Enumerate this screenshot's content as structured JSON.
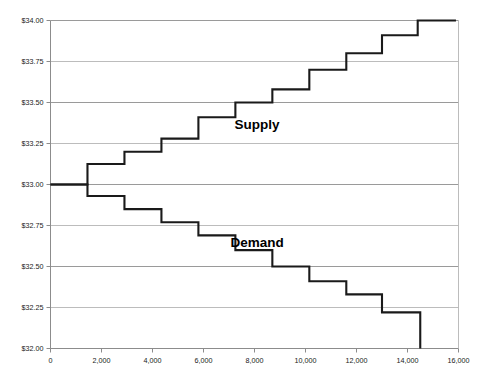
{
  "chart_data": {
    "type": "line",
    "subtype": "step-function",
    "title": "",
    "xlabel": "",
    "ylabel": "",
    "xlim": [
      0,
      16000
    ],
    "ylim": [
      32.0,
      34.0
    ],
    "grid": true,
    "grid_axis": "y",
    "legend_position": "inline-annotation",
    "x_ticks": [
      0,
      2000,
      4000,
      6000,
      8000,
      10000,
      12000,
      14000,
      16000
    ],
    "x_tick_labels": [
      "0",
      "2,000",
      "4,000",
      "6,000",
      "8,000",
      "10,000",
      "12,000",
      "14,000",
      "16,000"
    ],
    "y_ticks": [
      32.0,
      32.25,
      32.5,
      32.75,
      33.0,
      33.25,
      33.5,
      33.75,
      34.0
    ],
    "y_tick_labels": [
      "$32.00",
      "$32.25",
      "$32.50",
      "$32.75",
      "$33.00",
      "$33.25",
      "$33.50",
      "$33.75",
      "$34.00"
    ],
    "series": [
      {
        "name": "Supply",
        "label": "Supply",
        "color": "#1a1a1a",
        "step": "post",
        "annotation": {
          "text": "Supply",
          "x": 8100,
          "y": 33.34
        },
        "points": [
          [
            0,
            33.0
          ],
          [
            1450,
            33.0
          ],
          [
            1450,
            33.125
          ],
          [
            2900,
            33.125
          ],
          [
            2900,
            33.2
          ],
          [
            4350,
            33.2
          ],
          [
            4350,
            33.28
          ],
          [
            5800,
            33.28
          ],
          [
            5800,
            33.41
          ],
          [
            7250,
            33.41
          ],
          [
            7250,
            33.5
          ],
          [
            8700,
            33.5
          ],
          [
            8700,
            33.58
          ],
          [
            10150,
            33.58
          ],
          [
            10150,
            33.7
          ],
          [
            11600,
            33.7
          ],
          [
            11600,
            33.8
          ],
          [
            13000,
            33.8
          ],
          [
            13000,
            33.91
          ],
          [
            14400,
            33.91
          ],
          [
            14400,
            34.0
          ],
          [
            15900,
            34.0
          ]
        ]
      },
      {
        "name": "Demand",
        "label": "Demand",
        "color": "#1a1a1a",
        "step": "post",
        "annotation": {
          "text": "Demand",
          "x": 8100,
          "y": 32.62
        },
        "points": [
          [
            0,
            33.0
          ],
          [
            1450,
            33.0
          ],
          [
            1450,
            32.93
          ],
          [
            2900,
            32.93
          ],
          [
            2900,
            32.85
          ],
          [
            4350,
            32.85
          ],
          [
            4350,
            32.77
          ],
          [
            5800,
            32.77
          ],
          [
            5800,
            32.69
          ],
          [
            7250,
            32.69
          ],
          [
            7250,
            32.6
          ],
          [
            8700,
            32.6
          ],
          [
            8700,
            32.5
          ],
          [
            10150,
            32.5
          ],
          [
            10150,
            32.41
          ],
          [
            11600,
            32.41
          ],
          [
            11600,
            32.33
          ],
          [
            13000,
            32.33
          ],
          [
            13000,
            32.22
          ],
          [
            14500,
            32.22
          ],
          [
            14500,
            32.0
          ]
        ]
      }
    ]
  },
  "axis": {
    "y_axis_name": "price-axis",
    "x_axis_name": "quantity-axis"
  },
  "colors": {
    "curve": "#1a1a1a",
    "gridline": "#9a9a9a",
    "axis": "#8c8c8c",
    "background": "#ffffff",
    "text": "#1a1a1a"
  }
}
